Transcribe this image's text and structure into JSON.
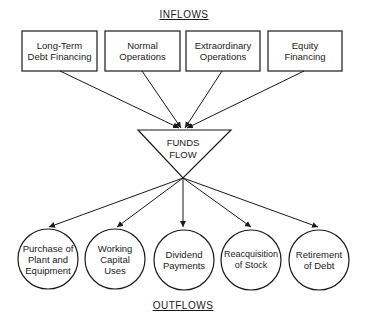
{
  "headings": {
    "inflows": "INFLOWS",
    "outflows": "OUTFLOWS"
  },
  "center": {
    "line1": "FUNDS",
    "line2": "FLOW"
  },
  "inflows": [
    {
      "line1": "Long-Term",
      "line2": "Debt Financing"
    },
    {
      "line1": "Normal",
      "line2": "Operations"
    },
    {
      "line1": "Extraordinary",
      "line2": "Operations"
    },
    {
      "line1": "Equity",
      "line2": "Financing"
    }
  ],
  "outflows": [
    {
      "line1": "Purchase of",
      "line2": "Plant and",
      "line3": "Equipment"
    },
    {
      "line1": "Working",
      "line2": "Capital",
      "line3": "Uses"
    },
    {
      "line1": "Dividend",
      "line2": "Payments",
      "line3": ""
    },
    {
      "line1": "Reacquisition",
      "line2": "of Stock",
      "line3": ""
    },
    {
      "line1": "Retirement",
      "line2": "of Debt",
      "line3": ""
    }
  ],
  "colors": {
    "stroke": "#1a1a1a",
    "background": "#ffffff"
  }
}
